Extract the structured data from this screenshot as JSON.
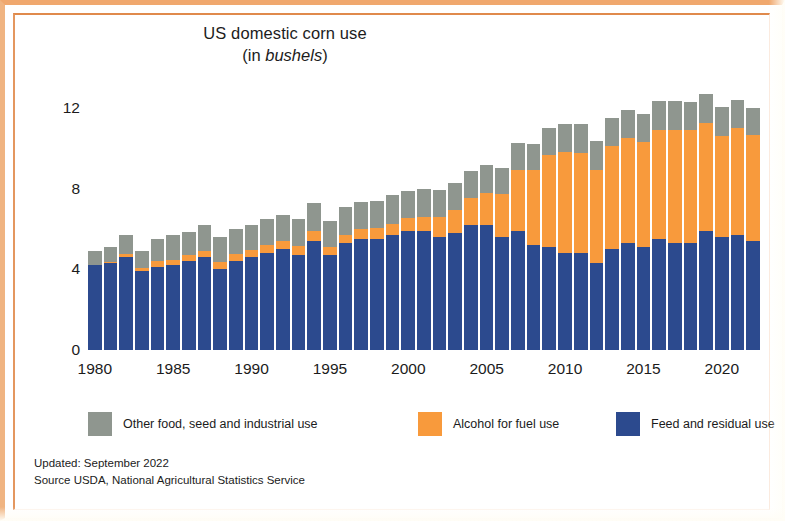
{
  "chart_data": {
    "type": "bar",
    "subtype": "stacked-bar",
    "title": "US domestic corn use",
    "subtitle": "(in bushels)",
    "subtitle_prefix": "(in ",
    "subtitle_emphasis": "bushels",
    "subtitle_suffix": ")",
    "xlabel": "",
    "ylabel": "",
    "ylim": [
      0,
      13
    ],
    "yticks": [
      0,
      4,
      8,
      12
    ],
    "xticks": [
      1980,
      1985,
      1990,
      1995,
      2000,
      2005,
      2010,
      2015,
      2020
    ],
    "grid": false,
    "legend_position": "bottom",
    "stack_order_bottom_to_top": [
      "Feed and residual use",
      "Alcohol for fuel use",
      "Other food, seed and industrial use"
    ],
    "categories": [
      1980,
      1981,
      1982,
      1983,
      1984,
      1985,
      1986,
      1987,
      1988,
      1989,
      1990,
      1991,
      1992,
      1993,
      1994,
      1995,
      1996,
      1997,
      1998,
      1999,
      2000,
      2001,
      2002,
      2003,
      2004,
      2005,
      2006,
      2007,
      2008,
      2009,
      2010,
      2011,
      2012,
      2013,
      2014,
      2015,
      2016,
      2017,
      2018,
      2019,
      2020,
      2021,
      2022
    ],
    "series": [
      {
        "name": "Feed and residual use",
        "color": "#2c4a8e",
        "values": [
          4.2,
          4.3,
          4.6,
          3.9,
          4.1,
          4.2,
          4.4,
          4.6,
          4.0,
          4.4,
          4.6,
          4.8,
          5.0,
          4.7,
          5.4,
          4.7,
          5.3,
          5.5,
          5.5,
          5.7,
          5.9,
          5.9,
          5.6,
          5.8,
          6.2,
          6.2,
          5.6,
          5.9,
          5.2,
          5.1,
          4.8,
          4.8,
          4.3,
          5.0,
          5.3,
          5.1,
          5.5,
          5.3,
          5.3,
          5.9,
          5.6,
          5.7,
          5.4
        ]
      },
      {
        "name": "Alcohol for fuel use",
        "color": "#f89a3c",
        "values": [
          0.03,
          0.08,
          0.14,
          0.17,
          0.31,
          0.28,
          0.3,
          0.33,
          0.35,
          0.35,
          0.35,
          0.4,
          0.43,
          0.46,
          0.53,
          0.4,
          0.43,
          0.48,
          0.53,
          0.57,
          0.63,
          0.71,
          1.0,
          1.17,
          1.32,
          1.6,
          2.12,
          3.03,
          3.71,
          4.57,
          5.02,
          5.0,
          4.65,
          5.13,
          5.2,
          5.21,
          5.43,
          5.61,
          5.6,
          5.38,
          5.03,
          5.32,
          5.28
        ]
      },
      {
        "name": "Other food, seed and industrial use",
        "color": "#8f968f",
        "values": [
          0.67,
          0.72,
          0.96,
          0.83,
          1.09,
          1.22,
          1.16,
          1.27,
          1.25,
          1.25,
          1.25,
          1.3,
          1.27,
          1.34,
          1.37,
          1.3,
          1.37,
          1.37,
          1.37,
          1.43,
          1.37,
          1.39,
          1.34,
          1.33,
          1.38,
          1.38,
          1.33,
          1.36,
          1.29,
          1.35,
          1.4,
          1.4,
          1.4,
          1.37,
          1.4,
          1.4,
          1.45,
          1.46,
          1.43,
          1.4,
          1.43,
          1.4,
          1.35
        ]
      }
    ],
    "annotations": []
  },
  "legend": {
    "items": [
      {
        "label": "Other food, seed and industrial use",
        "color": "#8f968f",
        "left_px": 0
      },
      {
        "label": "Alcohol for fuel use",
        "color": "#f89a3c",
        "left_px": 330
      },
      {
        "label": "Feed and residual use",
        "color": "#2c4a8e",
        "left_px": 528
      }
    ]
  },
  "footer": {
    "updated": "Updated: September 2022",
    "source": "Source USDA, National Agricultural Statistics Service"
  },
  "theme": {
    "frame_color": "#e08a4c",
    "background": "#ffffff",
    "text_color": "#1b1b1b"
  }
}
